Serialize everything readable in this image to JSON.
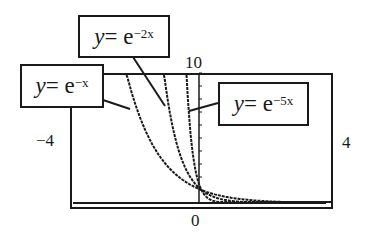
{
  "chart_data": {
    "type": "line",
    "title": "",
    "xlabel": "",
    "ylabel": "",
    "xlim": [
      -4,
      4
    ],
    "ylim": [
      0,
      10
    ],
    "grid": false,
    "tick_labels": {
      "xmin": "−4",
      "xmax": "4",
      "ymin": "0",
      "ymax": "10"
    },
    "series": [
      {
        "name": "y = e^(−x)",
        "k": 1,
        "label": {
          "lhs": "y",
          "eq": " = e",
          "exp": "−x"
        }
      },
      {
        "name": "y = e^(−2x)",
        "k": 2,
        "label": {
          "lhs": "y",
          "eq": " = e",
          "exp": "−2x"
        }
      },
      {
        "name": "y = e^(−5x)",
        "k": 5,
        "label": {
          "lhs": "y",
          "eq": " = e",
          "exp": "−5x"
        }
      }
    ],
    "line_color": "#1a1a1a"
  }
}
